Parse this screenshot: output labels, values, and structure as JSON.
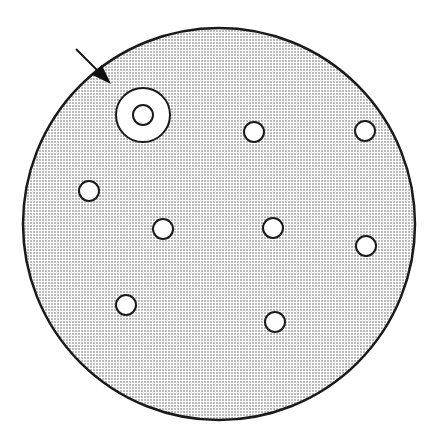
{
  "diagram": {
    "type": "petri-dish-with-holes",
    "colors": {
      "fill_dots": "#555555",
      "background": "#ffffff",
      "stroke": "#1a1a1a"
    },
    "dish": {
      "cx": 219,
      "cy": 224,
      "r": 196
    },
    "target": {
      "cx": 143,
      "cy": 115,
      "outer_r": 27,
      "inner_r": 10
    },
    "holes": [
      {
        "cx": 254,
        "cy": 132,
        "r": 10
      },
      {
        "cx": 365,
        "cy": 131,
        "r": 10
      },
      {
        "cx": 89,
        "cy": 191,
        "r": 10
      },
      {
        "cx": 163,
        "cy": 229,
        "r": 10
      },
      {
        "cx": 273,
        "cy": 228,
        "r": 10
      },
      {
        "cx": 366,
        "cy": 246,
        "r": 10
      },
      {
        "cx": 126,
        "cy": 305,
        "r": 10
      },
      {
        "cx": 275,
        "cy": 322,
        "r": 10
      }
    ],
    "arrow": {
      "x1": 76,
      "y1": 49,
      "x2": 111,
      "y2": 84
    }
  }
}
